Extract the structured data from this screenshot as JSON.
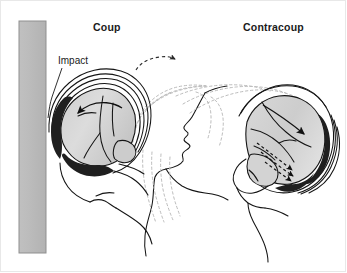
{
  "figure": {
    "width": 347,
    "height": 273,
    "background_color": "#ffffff",
    "border_color": "#e8e8e8"
  },
  "labels": {
    "coup": "Coup",
    "contracoup": "Contracoup",
    "impact": "Impact"
  },
  "colors": {
    "wall_fill": "#b9b9b9",
    "wall_stroke": "#8c8c8c",
    "brain_light": "#e2e2e2",
    "brain_mid": "#c9c9c9",
    "brain_dark": "#b0b0b0",
    "lesion": "#1f1f1f",
    "outline": "#111111",
    "motion_dash": "#b5b5b5",
    "text": "#1a1a1a"
  },
  "elements": {
    "impact_wall": "vertical-gray-barrier",
    "left_head": "coup-head-cross-section",
    "right_head": "contracoup-head-cross-section",
    "center_head": "mid-motion-head-profile",
    "motion_trails": "dashed-head-displacement-trails",
    "top_arc_arrow": "dashed-rotation-arrow",
    "impact_leader": "impact-callout-leader-line"
  },
  "annotations": {
    "coup_lesion_side": "anterior",
    "contracoup_lesion_side": "posterior",
    "coup_arrow_direction": "leftward-toward-impact",
    "contracoup_arrow_direction": "rightward-away-from-impact"
  }
}
